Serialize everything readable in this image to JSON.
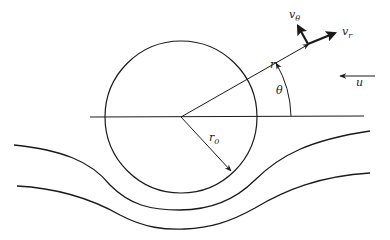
{
  "figure": {
    "labels": {
      "r": "r",
      "r0": "r",
      "r0_sub": "0",
      "theta": "θ",
      "v_r": "v",
      "v_r_sub": "r",
      "v_theta": "v",
      "v_theta_sub": "θ",
      "u": "u"
    },
    "elements": [
      "cylinder",
      "horizontal-axis",
      "radius-vector-r",
      "radius-r0",
      "angle-arc-theta",
      "velocity-component-vr",
      "velocity-component-vtheta",
      "free-stream-u",
      "streamline-1",
      "streamline-2"
    ],
    "colors": {
      "stroke": "#1a1a1a",
      "background": "#ffffff"
    }
  }
}
